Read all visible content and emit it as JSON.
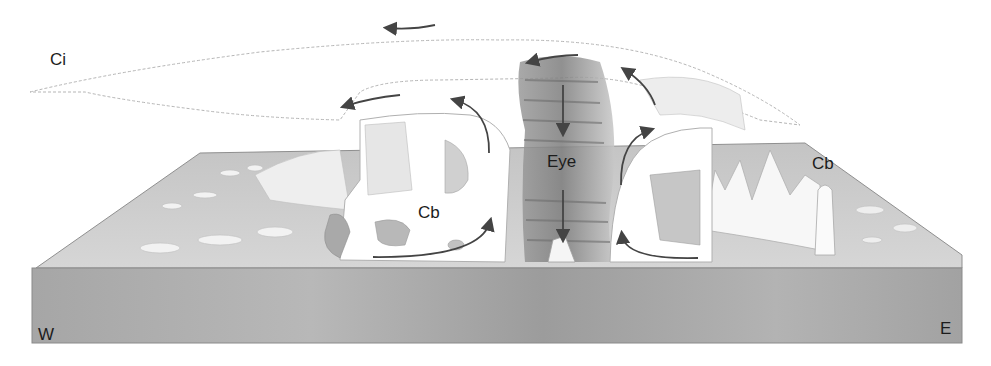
{
  "diagram": {
    "labels": {
      "cirrus": "Ci",
      "eye": "Eye",
      "cumulonimbus_left": "Cb",
      "cumulonimbus_right": "Cb",
      "west": "W",
      "east": "E"
    },
    "colors": {
      "sea_top": "#c9c9c9",
      "sea_front": "#9e9e9e",
      "cloud": "#ffffff",
      "cloud_outline": "#a8a8a8",
      "eye_wall_shade": "#8a8a8a",
      "arrow": "#444444",
      "text": "#1c1c1c"
    }
  }
}
